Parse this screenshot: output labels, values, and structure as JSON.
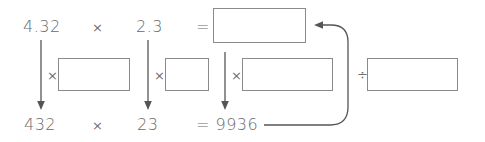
{
  "top_row": {
    "factor_a": "4.32",
    "times": "×",
    "factor_b": "2.3",
    "equals": "=",
    "answer_box": ""
  },
  "middle_row": {
    "op1": "×",
    "box1": "",
    "op2": "×",
    "box2": "",
    "op3": "×",
    "box3": "",
    "op4": "÷",
    "box4": ""
  },
  "bottom_row": {
    "factor_a": "432",
    "times": "×",
    "factor_b": "23",
    "equals_result": "= 9936"
  },
  "colors": {
    "text": "#6a6a6a",
    "lines": "#555555",
    "box_border": "#8a8a8a"
  }
}
